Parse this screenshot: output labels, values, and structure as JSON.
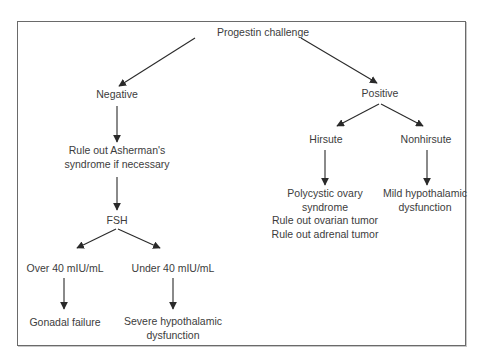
{
  "diagram": {
    "type": "flowchart",
    "root": "Progestin challenge",
    "nodes": {
      "root": {
        "label": "Progestin challenge"
      },
      "negative": {
        "label": "Negative"
      },
      "asherman": {
        "lines": [
          "Rule out Asherman's",
          "syndrome if necessary"
        ]
      },
      "fsh": {
        "label": "FSH"
      },
      "over40": {
        "label": "Over 40 mIU/mL"
      },
      "under40": {
        "label": "Under 40 mIU/mL"
      },
      "gonadal": {
        "label": "Gonadal failure"
      },
      "severe": {
        "lines": [
          "Severe hypothalamic",
          "dysfunction"
        ]
      },
      "positive": {
        "label": "Positive"
      },
      "hirsute": {
        "label": "Hirsute"
      },
      "nonhirsute": {
        "label": "Nonhirsute"
      },
      "pcos": {
        "lines": [
          "Polycystic ovary",
          "syndrome",
          "Rule out ovarian tumor",
          "Rule out adrenal tumor"
        ]
      },
      "mild": {
        "lines": [
          "Mild hypothalamic",
          "dysfunction"
        ]
      }
    },
    "edges": [
      [
        "root",
        "negative"
      ],
      [
        "root",
        "positive"
      ],
      [
        "negative",
        "asherman"
      ],
      [
        "asherman",
        "fsh"
      ],
      [
        "fsh",
        "over40"
      ],
      [
        "fsh",
        "under40"
      ],
      [
        "over40",
        "gonadal"
      ],
      [
        "under40",
        "severe"
      ],
      [
        "positive",
        "hirsute"
      ],
      [
        "positive",
        "nonhirsute"
      ],
      [
        "hirsute",
        "pcos"
      ],
      [
        "nonhirsute",
        "mild"
      ]
    ],
    "colors": {
      "line": "#2a2a2a",
      "text": "#3c3c3c",
      "border": "#6a6a6a"
    }
  }
}
